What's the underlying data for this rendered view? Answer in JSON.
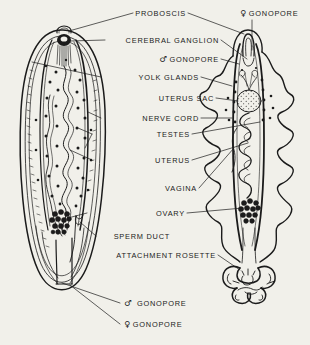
{
  "figure": {
    "background_color": "#f1f0ea",
    "ink_color": "#1b1b1b",
    "symbols": {
      "male": "♂",
      "female": "♀"
    }
  },
  "labels": [
    {
      "id": "proboscis",
      "text": "PROBOSCIS",
      "x": 160,
      "y": 13,
      "align": "center"
    },
    {
      "id": "female-gonopore-top",
      "text": "GONOPORE",
      "symbol": "♀",
      "x": 240,
      "y": 13,
      "align": "left"
    },
    {
      "id": "cerebral-ganglion",
      "text": "CEREBRAL GANGLION",
      "x": 219,
      "y": 40,
      "align": "right"
    },
    {
      "id": "male-gonopore-mid",
      "text": "GONOPORE",
      "symbol": "♂",
      "x": 219,
      "y": 59,
      "align": "right"
    },
    {
      "id": "yolk-glands",
      "text": "YOLK GLANDS",
      "x": 199,
      "y": 77,
      "align": "right"
    },
    {
      "id": "uterus-sac",
      "text": "UTERUS SAC",
      "x": 214,
      "y": 98,
      "align": "right"
    },
    {
      "id": "nerve-cord",
      "text": "NERVE CORD",
      "x": 199,
      "y": 118,
      "align": "right"
    },
    {
      "id": "testes",
      "text": "TESTES",
      "x": 190,
      "y": 134,
      "align": "right"
    },
    {
      "id": "uterus",
      "text": "UTERUS",
      "x": 190,
      "y": 160,
      "align": "right"
    },
    {
      "id": "vagina",
      "text": "VAGINA",
      "x": 197,
      "y": 188,
      "align": "right"
    },
    {
      "id": "ovary",
      "text": "OVARY",
      "x": 185,
      "y": 213,
      "align": "right"
    },
    {
      "id": "sperm-duct",
      "text": "SPERM DUCT",
      "x": 170,
      "y": 236,
      "align": "right"
    },
    {
      "id": "attachment-rosette",
      "text": "ATTACHMENT ROSETTE",
      "x": 216,
      "y": 255,
      "align": "right"
    },
    {
      "id": "male-gonopore-bot",
      "text": "GONOPORE",
      "symbol": "♂",
      "x": 124,
      "y": 303,
      "align": "left"
    },
    {
      "id": "female-gonopore-bot",
      "text": "GONOPORE",
      "symbol": "♀",
      "x": 124,
      "y": 324,
      "align": "left"
    }
  ],
  "organisms": [
    {
      "id": "left-organism",
      "name": "smooth-bodied flatworm",
      "features": [
        "proboscis",
        "cerebral ganglion",
        "yolk glands",
        "nerve cord",
        "testes",
        "uterus",
        "ovary",
        "sperm duct",
        "male gonopore",
        "female gonopore"
      ]
    },
    {
      "id": "right-organism",
      "name": "frilled-bodied flatworm",
      "features": [
        "proboscis",
        "female gonopore",
        "uterus sac",
        "uterus",
        "vagina",
        "ovary",
        "attachment rosette"
      ]
    }
  ]
}
